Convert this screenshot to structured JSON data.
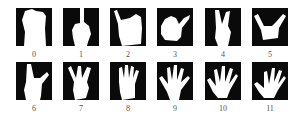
{
  "figure": {
    "colors": {
      "background": "#ffffff",
      "box": "#0a0a0a",
      "hand": "#ffffff",
      "label": "#555555"
    },
    "gestures": [
      {
        "id": "0",
        "label": "0",
        "shape": "fist"
      },
      {
        "id": "1",
        "label": "1",
        "shape": "one-finger"
      },
      {
        "id": "2",
        "label": "2",
        "shape": "thumb-angled"
      },
      {
        "id": "3",
        "label": "3",
        "shape": "thumb-side"
      },
      {
        "id": "4",
        "label": "4",
        "shape": "two-fingers-v"
      },
      {
        "id": "5",
        "label": "5",
        "shape": "thumb-pinky"
      },
      {
        "id": "6",
        "label": "6",
        "shape": "thumb-index-l"
      },
      {
        "id": "7",
        "label": "7",
        "shape": "three-fingers"
      },
      {
        "id": "8",
        "label": "8",
        "shape": "four-fingers"
      },
      {
        "id": "9",
        "label": "9",
        "shape": "open-hand"
      },
      {
        "id": "10",
        "label": "10",
        "shape": "open-hand-spread"
      },
      {
        "id": "11",
        "label": "11",
        "shape": "open-hand-tilted"
      }
    ]
  }
}
